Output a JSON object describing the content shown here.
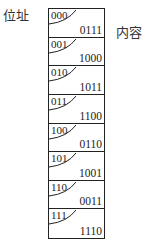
{
  "labels": {
    "address": "位址",
    "content": "内容"
  },
  "memory": {
    "cells": [
      {
        "address": "000",
        "content": "0111"
      },
      {
        "address": "001",
        "content": "1000"
      },
      {
        "address": "010",
        "content": "1011"
      },
      {
        "address": "011",
        "content": "1100"
      },
      {
        "address": "100",
        "content": "0110"
      },
      {
        "address": "101",
        "content": "1001"
      },
      {
        "address": "110",
        "content": "0011"
      },
      {
        "address": "111",
        "content": "1110"
      }
    ]
  },
  "colors": {
    "line": "#222222",
    "text": "#222222",
    "background": "#ffffff"
  }
}
